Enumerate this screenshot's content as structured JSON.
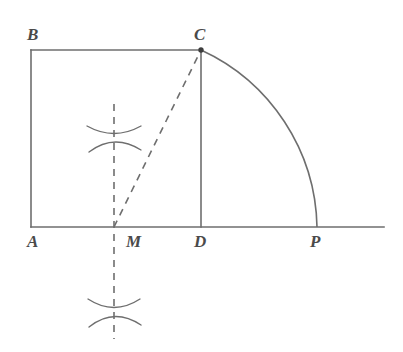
{
  "figure": {
    "kind": "geometry-construction-diagram",
    "stroke_color": "#6e6e6e",
    "label_color": "#4a4a4a",
    "background_color": "#ffffff",
    "stroke_width": 1.6,
    "dash_pattern": "7 6",
    "points": [
      {
        "id": "A",
        "label": "A",
        "x": 31,
        "y": 227,
        "label_x": 27,
        "label_y": 247,
        "marker": false
      },
      {
        "id": "B",
        "label": "B",
        "x": 31,
        "y": 50,
        "label_x": 27,
        "label_y": 40,
        "marker": false
      },
      {
        "id": "C",
        "label": "C",
        "x": 201,
        "y": 50,
        "label_x": 194,
        "label_y": 40,
        "marker": true
      },
      {
        "id": "D",
        "label": "D",
        "x": 201,
        "y": 227,
        "label_x": 194,
        "label_y": 247,
        "marker": false
      },
      {
        "id": "M",
        "label": "M",
        "x": 114,
        "y": 227,
        "label_x": 126,
        "label_y": 247,
        "marker": false
      },
      {
        "id": "P",
        "label": "P",
        "x": 317,
        "y": 227,
        "label_x": 310,
        "label_y": 247,
        "marker": false
      }
    ],
    "solid_segments": [
      {
        "name": "square-side-AB",
        "x1": 31,
        "y1": 227,
        "x2": 31,
        "y2": 50
      },
      {
        "name": "square-side-BC",
        "x1": 31,
        "y1": 50,
        "x2": 201,
        "y2": 50
      },
      {
        "name": "square-side-CD",
        "x1": 201,
        "y1": 50,
        "x2": 201,
        "y2": 227
      },
      {
        "name": "baseline-A-to-right-edge",
        "x1": 31,
        "y1": 227,
        "x2": 384,
        "y2": 227
      }
    ],
    "dashed_segments": [
      {
        "name": "segment-MC",
        "x1": 114,
        "y1": 227,
        "x2": 201,
        "y2": 50
      },
      {
        "name": "perpendicular-bisector-line",
        "x1": 114,
        "y1": 104,
        "x2": 114,
        "y2": 339
      }
    ],
    "arcs": [
      {
        "name": "quarter-arc-C-to-P",
        "center_x": 114,
        "center_y": 227,
        "radius": 199,
        "from_x": 201,
        "from_y": 50,
        "to_x": 317,
        "to_y": 227
      }
    ],
    "compass_marks": [
      {
        "name": "compass-cross-upper",
        "cx": 114,
        "cy": 137,
        "arc_a": {
          "x1": 87,
          "y1": 126,
          "cx": 114,
          "cy": 141,
          "x2": 141,
          "y2": 126
        },
        "arc_b": {
          "x1": 89,
          "y1": 152,
          "cx": 114,
          "cy": 133,
          "x2": 141,
          "y2": 150
        }
      },
      {
        "name": "compass-cross-lower",
        "cx": 114,
        "cy": 312,
        "arc_a": {
          "x1": 88,
          "y1": 299,
          "cx": 114,
          "cy": 316,
          "x2": 140,
          "y2": 299
        },
        "arc_b": {
          "x1": 89,
          "y1": 327,
          "cx": 114,
          "cy": 307,
          "x2": 141,
          "y2": 325
        }
      }
    ]
  }
}
